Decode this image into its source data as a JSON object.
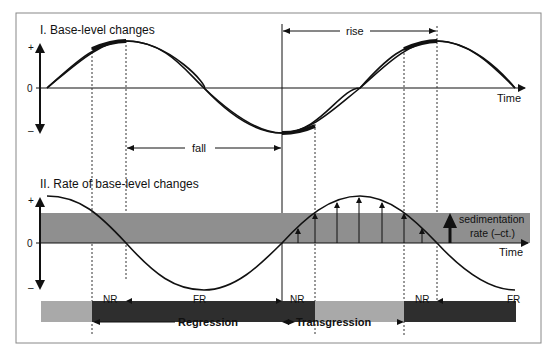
{
  "panel1": {
    "title": "I. Base-level changes",
    "axis_plus": "+",
    "axis_zero": "0",
    "axis_minus": "–",
    "x_label": "Time",
    "fall_label": "fall",
    "rise_label": "rise"
  },
  "panel2": {
    "title": "II. Rate of base-level changes",
    "axis_plus": "+",
    "axis_zero": "0",
    "axis_minus": "–",
    "x_label": "Time",
    "sedimentation_label_line1": "sedimentation",
    "sedimentation_label_line2": "rate (–ct.)"
  },
  "bars": {
    "nr_label_1": "NR",
    "fr_label_1": "FR",
    "nr_label_2": "NR",
    "nr_label_3": "NR",
    "fr_label_2": "FR",
    "regression_label": "Regression",
    "transgression_label": "Transgression"
  },
  "colors": {
    "frame": "#888888",
    "curve": "#111111",
    "band": "#8f8f8f",
    "bar_dark": "#2e2e2e",
    "bar_light": "#a9a9a9"
  }
}
